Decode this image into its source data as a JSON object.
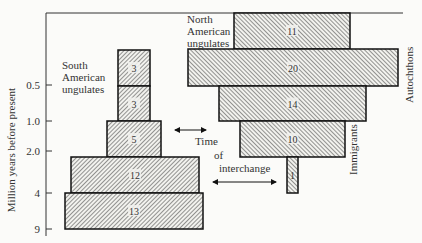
{
  "chart_data": {
    "type": "bar",
    "orientation": "horizontal-stacked-pyramid",
    "title": "",
    "xlabel": "",
    "ylabel": "Million years before present",
    "y_ticks": [
      "0.5",
      "1.0",
      "2.0",
      "4",
      "9"
    ],
    "time_bins": [
      "<0.5",
      "0.5–1.0",
      "1.0–2.0",
      "2.0–4",
      "4–9"
    ],
    "legend": [],
    "annotations": {
      "south_label": [
        "South",
        "American",
        "ungulates"
      ],
      "north_label": [
        "North",
        "American",
        "ungulates"
      ],
      "autochthons": "Autochthons",
      "immigrants": "Immigrants",
      "interchange_line1": "Time",
      "interchange_line2": "of",
      "interchange_line3": "interchange"
    },
    "series": [
      {
        "name": "South American ungulates",
        "values": [
          3,
          3,
          5,
          12,
          13
        ]
      },
      {
        "name": "North American ungulates",
        "values": [
          11,
          20,
          14,
          10,
          1
        ],
        "groups": {
          "Immigrants": [
            11,
            20,
            14,
            10
          ],
          "Autochthons": [
            1
          ]
        }
      }
    ],
    "grid": false
  },
  "axis": {
    "label": "Million years before present",
    "ticks": [
      {
        "label": "0.5",
        "y": 85
      },
      {
        "label": "1.0",
        "y": 121
      },
      {
        "label": "2.0",
        "y": 151
      },
      {
        "label": "4",
        "y": 193
      },
      {
        "label": "9",
        "y": 229
      }
    ]
  },
  "south_bars": [
    {
      "value": "3",
      "x": 118,
      "y": 50,
      "w": 32,
      "h": 36
    },
    {
      "value": "3",
      "x": 118,
      "y": 86,
      "w": 32,
      "h": 35
    },
    {
      "value": "5",
      "x": 107,
      "y": 121,
      "w": 54,
      "h": 36
    },
    {
      "value": "12",
      "x": 71,
      "y": 157,
      "w": 128,
      "h": 36
    },
    {
      "value": "13",
      "x": 65,
      "y": 193,
      "w": 138,
      "h": 36
    }
  ],
  "north_bars": [
    {
      "value": "11",
      "x": 234,
      "y": 13,
      "w": 116,
      "h": 36
    },
    {
      "value": "20",
      "x": 188,
      "y": 49,
      "w": 210,
      "h": 37
    },
    {
      "value": "14",
      "x": 219,
      "y": 86,
      "w": 147,
      "h": 35
    },
    {
      "value": "10",
      "x": 240,
      "y": 121,
      "w": 105,
      "h": 36
    },
    {
      "value": "1",
      "x": 287,
      "y": 157,
      "w": 11,
      "h": 36
    }
  ]
}
